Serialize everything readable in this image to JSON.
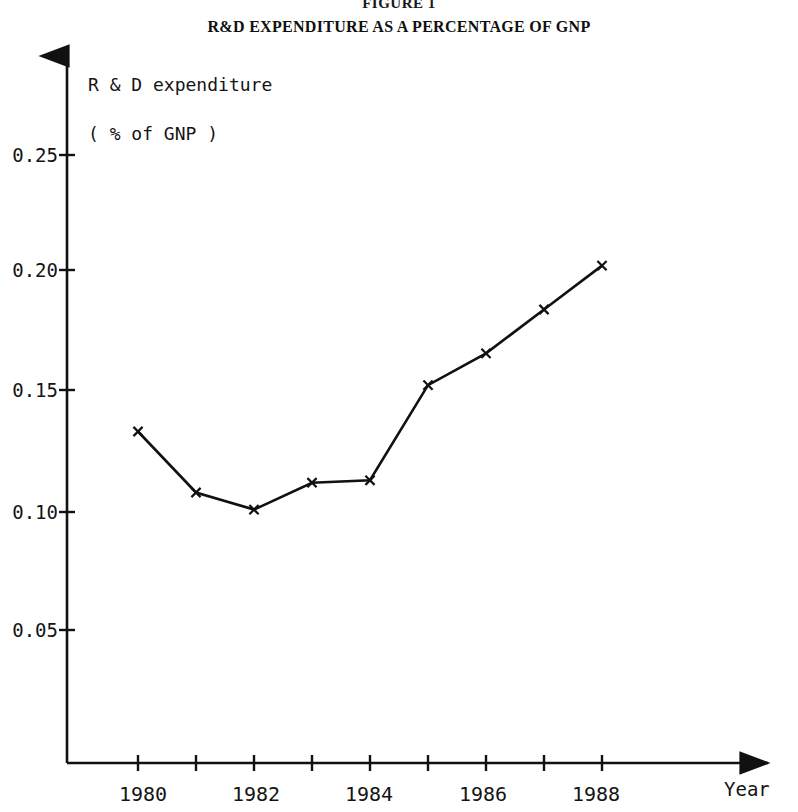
{
  "figure": {
    "number": "FIGURE 1",
    "title": "R&D EXPENDITURE AS A PERCENTAGE OF GNP"
  },
  "axis_caption": {
    "line1": "R & D expenditure",
    "line2": "( % of GNP )"
  },
  "x_axis_title": "Year",
  "chart_data": {
    "type": "line",
    "title": "R&D EXPENDITURE AS A PERCENTAGE OF GNP",
    "subtitle": "FIGURE 1",
    "xlabel": "Year",
    "ylabel": "R & D expenditure ( % of GNP )",
    "x": [
      1980,
      1981,
      1982,
      1983,
      1984,
      1985,
      1986,
      1987,
      1988
    ],
    "values": [
      0.133,
      0.108,
      0.101,
      0.112,
      0.113,
      0.152,
      0.165,
      0.183,
      0.201
    ],
    "xtick_values": [
      1980,
      1981,
      1982,
      1983,
      1984,
      1985,
      1986,
      1987,
      1988
    ],
    "xtick_labels": [
      "1980",
      "",
      "1982",
      "",
      "1984",
      "",
      "1986",
      "",
      "1988"
    ],
    "ytick_values": [
      0.05,
      0.1,
      0.15,
      0.2,
      0.25
    ],
    "ytick_labels": [
      "0.05",
      "0.10",
      "0.15",
      "0.20",
      "0.25"
    ],
    "xlim": [
      1979.0,
      1990.6
    ],
    "ylim": [
      0.0,
      0.2857
    ],
    "grid": false,
    "legend": "none",
    "marker": "x-cross",
    "line_color": "#111111"
  },
  "ytick_labels": [
    "0.25",
    "0.20",
    "0.15",
    "0.10",
    "0.05"
  ],
  "xtick_labels": [
    "1980",
    "1982",
    "1984",
    "1986",
    "1988"
  ]
}
